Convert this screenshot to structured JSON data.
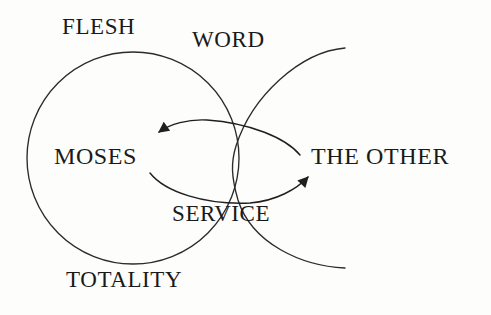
{
  "diagram": {
    "background_color": "#fdfdfb",
    "stroke_color": "#262626",
    "text_color": "#1a1a1a",
    "labels": {
      "flesh": "FLESH",
      "word": "WORD",
      "moses": "MOSES",
      "the_other": "THE OTHER",
      "service": "SERVICE",
      "totality": "TOTALITY"
    },
    "shapes": {
      "circle": {
        "name": "totality-circle",
        "cx": 133,
        "cy": 158,
        "r": 106
      },
      "crossing_arc": {
        "name": "word-service-arc",
        "start_x": 345,
        "start_y": 48,
        "end_x": 345,
        "end_y": 268
      },
      "arrow_to_moses": {
        "name": "arrow-pointing-left",
        "direction": "left",
        "tip_x": 157,
        "tip_y": 133
      },
      "arrow_to_other": {
        "name": "arrow-pointing-right",
        "direction": "right",
        "tip_x": 310,
        "tip_y": 173
      }
    }
  }
}
